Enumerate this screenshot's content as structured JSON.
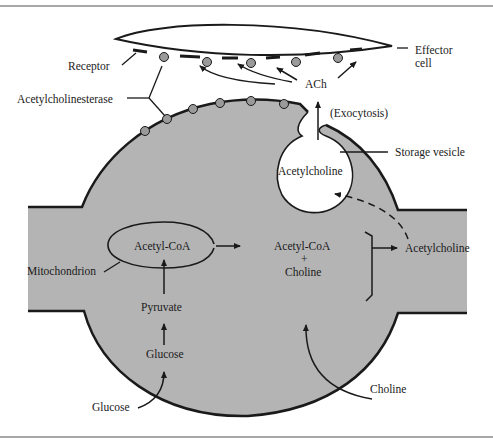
{
  "diagram": {
    "colors": {
      "background": "#ffffff",
      "cytoplasm": "#b4b4b4",
      "outline": "#1a1a1a",
      "enzyme_dot": "#9a9a9a",
      "frame_line": "#8a8a8a"
    },
    "labels": {
      "receptor": "Receptor",
      "acetylcholinesterase": "Acetylcholinesterase",
      "ach": "ACh",
      "effector_cell_line1": "Effector",
      "effector_cell_line2": "cell",
      "exocytosis": "(Exocytosis)",
      "storage_vesicle": "Storage vesicle",
      "vesicle_content": "Acetylcholine",
      "mito_acetyl_coa": "Acetyl-CoA",
      "mitochondrion": "Mitochondrion",
      "cytosol_acetyl_coa": "Acetyl-CoA",
      "plus": "+",
      "cytosol_choline": "Choline",
      "product_acetylcholine": "Acetylcholine",
      "pyruvate": "Pyruvate",
      "glucose_inside": "Glucose",
      "glucose_outside": "Glucose",
      "choline_outside": "Choline"
    },
    "nodes": [
      {
        "id": "glucose_out",
        "label": "Glucose",
        "region": "extracellular"
      },
      {
        "id": "glucose_in",
        "label": "Glucose",
        "region": "cytoplasm"
      },
      {
        "id": "pyruvate",
        "label": "Pyruvate",
        "region": "cytoplasm"
      },
      {
        "id": "acetyl_coa_mito",
        "label": "Acetyl-CoA",
        "region": "mitochondrion"
      },
      {
        "id": "acetyl_coa_choline",
        "label": "Acetyl-CoA + Choline",
        "region": "cytoplasm"
      },
      {
        "id": "choline_out",
        "label": "Choline",
        "region": "extracellular"
      },
      {
        "id": "acetylcholine_cyto",
        "label": "Acetylcholine",
        "region": "cytoplasm"
      },
      {
        "id": "acetylcholine_vesicle",
        "label": "Acetylcholine",
        "region": "storage vesicle"
      },
      {
        "id": "ach_cleft",
        "label": "ACh",
        "region": "synaptic cleft"
      },
      {
        "id": "receptor",
        "label": "Receptor",
        "region": "effector cell membrane"
      }
    ],
    "edges": [
      {
        "from": "glucose_out",
        "to": "glucose_in",
        "style": "solid"
      },
      {
        "from": "glucose_in",
        "to": "pyruvate",
        "style": "solid"
      },
      {
        "from": "pyruvate",
        "to": "acetyl_coa_mito",
        "style": "solid"
      },
      {
        "from": "acetyl_coa_mito",
        "to": "acetyl_coa_choline",
        "style": "solid"
      },
      {
        "from": "choline_out",
        "to": "acetyl_coa_choline",
        "style": "solid"
      },
      {
        "from": "acetyl_coa_choline",
        "to": "acetylcholine_cyto",
        "style": "solid"
      },
      {
        "from": "acetylcholine_cyto",
        "to": "acetylcholine_vesicle",
        "style": "dashed"
      },
      {
        "from": "acetylcholine_vesicle",
        "to": "ach_cleft",
        "style": "solid",
        "label": "(Exocytosis)"
      },
      {
        "from": "ach_cleft",
        "to": "receptor",
        "style": "solid",
        "count": 4
      }
    ]
  }
}
